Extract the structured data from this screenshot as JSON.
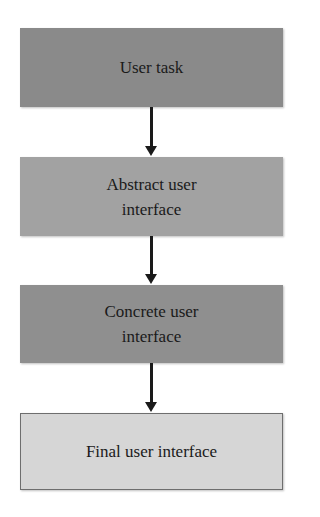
{
  "diagram": {
    "type": "flowchart",
    "direction": "top-to-bottom",
    "nodes": [
      {
        "id": "user-task",
        "label": "User task",
        "fill": "#8a8a8a"
      },
      {
        "id": "abstract-ui",
        "label": "Abstract user interface",
        "fill": "#a2a2a2"
      },
      {
        "id": "concrete-ui",
        "label": "Concrete user interface",
        "fill": "#8f8f8f"
      },
      {
        "id": "final-ui",
        "label": "Final user interface",
        "fill": "#d6d6d6"
      }
    ],
    "edges": [
      {
        "from": "user-task",
        "to": "abstract-ui"
      },
      {
        "from": "abstract-ui",
        "to": "concrete-ui"
      },
      {
        "from": "concrete-ui",
        "to": "final-ui"
      }
    ]
  }
}
